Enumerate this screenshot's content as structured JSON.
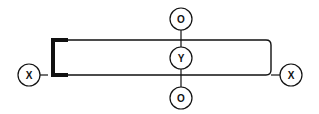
{
  "diagram": {
    "nodes": [
      {
        "id": "left-x",
        "label": "X"
      },
      {
        "id": "top-o",
        "label": "O"
      },
      {
        "id": "center-y",
        "label": "Y"
      },
      {
        "id": "bottom-o",
        "label": "O"
      },
      {
        "id": "right-x",
        "label": "X"
      }
    ],
    "colors": {
      "stroke": "#111111",
      "background": "#ffffff"
    }
  }
}
